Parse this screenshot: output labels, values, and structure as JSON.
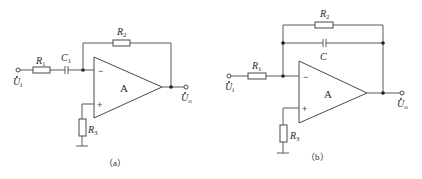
{
  "figure": {
    "background": "#ffffff",
    "line_color": "#5a5a5a",
    "circuits": [
      {
        "id": "a",
        "caption": "（a）",
        "input_label": "U",
        "input_sub": "i",
        "output_label": "U",
        "output_sub": "o",
        "amp_label": "A",
        "minus": "−",
        "plus": "+",
        "components": {
          "R1": {
            "label": "R",
            "sub": "1"
          },
          "C1": {
            "label": "C",
            "sub": "1"
          },
          "R2": {
            "label": "R",
            "sub": "2"
          },
          "R3": {
            "label": "R",
            "sub": "3"
          }
        }
      },
      {
        "id": "b",
        "caption": "（b）",
        "input_label": "U",
        "input_sub": "i",
        "output_label": "U",
        "output_sub": "o",
        "amp_label": "A",
        "minus": "−",
        "plus": "+",
        "components": {
          "R1": {
            "label": "R",
            "sub": "1"
          },
          "R2": {
            "label": "R",
            "sub": "2"
          },
          "C": {
            "label": "C",
            "sub": ""
          },
          "R3": {
            "label": "R",
            "sub": "3"
          }
        }
      }
    ]
  }
}
